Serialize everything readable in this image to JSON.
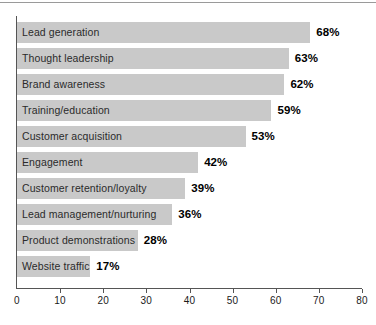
{
  "figure": {
    "background_color": "#ffffff",
    "rule_color": "#9a9a9a",
    "axis_color": "#555555",
    "bar_color": "#c9c9c9",
    "label_color": "#2b2b2b",
    "value_color": "#000000"
  },
  "chart_data": {
    "type": "bar",
    "orientation": "horizontal",
    "title": "",
    "subtitle": "",
    "xlabel": "",
    "ylabel": "",
    "xlim": [
      0,
      80
    ],
    "grid": false,
    "legend": null,
    "xticks": [
      0,
      10,
      20,
      30,
      40,
      50,
      60,
      70,
      80
    ],
    "xticklabels": [
      "0",
      "10",
      "20",
      "30",
      "40",
      "50",
      "60",
      "70",
      "80"
    ],
    "categories": [
      "Lead generation",
      "Thought leadership",
      "Brand awareness",
      "Training/education",
      "Customer acquisition",
      "Engagement",
      "Customer retention/loyalty",
      "Lead management/nurturing",
      "Product demonstrations",
      "Website traffic"
    ],
    "values": [
      68,
      63,
      62,
      59,
      53,
      42,
      39,
      36,
      28,
      17
    ],
    "data_labels": [
      "68%",
      "63%",
      "62%",
      "59%",
      "53%",
      "42%",
      "39%",
      "36%",
      "28%",
      "17%"
    ]
  }
}
